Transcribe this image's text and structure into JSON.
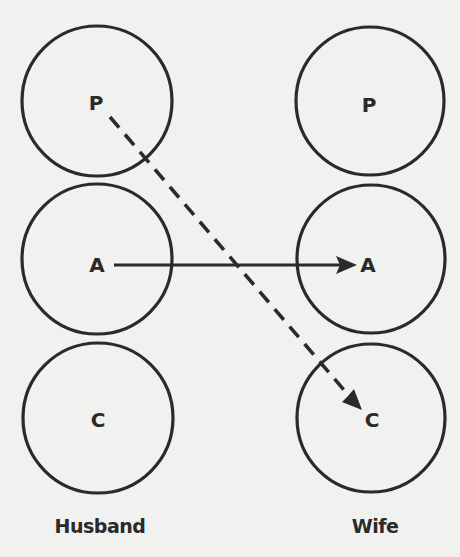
{
  "diagram": {
    "type": "transactional-analysis",
    "columns": [
      {
        "id": "husband",
        "label": "Husband",
        "states": [
          {
            "id": "P",
            "label": "P"
          },
          {
            "id": "A",
            "label": "A"
          },
          {
            "id": "C",
            "label": "C"
          }
        ]
      },
      {
        "id": "wife",
        "label": "Wife",
        "states": [
          {
            "id": "P",
            "label": "P"
          },
          {
            "id": "A",
            "label": "A"
          },
          {
            "id": "C",
            "label": "C"
          }
        ]
      }
    ],
    "transactions": [
      {
        "from": "husband.A",
        "to": "wife.A",
        "style": "solid"
      },
      {
        "from": "husband.P",
        "to": "wife.C",
        "style": "dashed"
      }
    ],
    "colors": {
      "ink": "#2a2a2a",
      "paper": "#f1f1ef"
    }
  }
}
